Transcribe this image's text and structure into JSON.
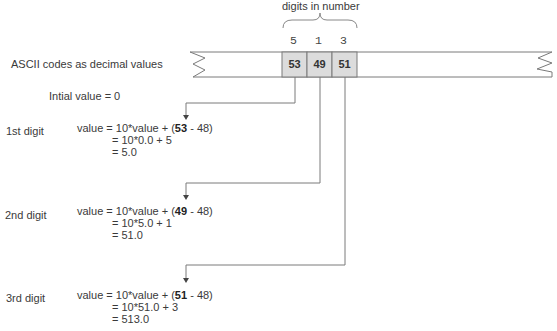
{
  "header": {
    "bracket_label": "digits in number"
  },
  "strip": {
    "label": "ASCII codes as decimal values",
    "digits": [
      "5",
      "1",
      "3"
    ],
    "codes": [
      "53",
      "49",
      "51"
    ],
    "box_fill": "#dcdcdc",
    "line_color": "#7a7a7a"
  },
  "initial": {
    "text": "Intial value = 0"
  },
  "steps": [
    {
      "label": "1st digit",
      "line1_prefix": "value = 10*value + (",
      "code": "53",
      "line1_suffix": " - 48)",
      "line2": "= 10*0.0 + 5",
      "line3": "= 5.0"
    },
    {
      "label": "2nd digit",
      "line1_prefix": "value = 10*value + (",
      "code": "49",
      "line1_suffix": " - 48)",
      "line2": "= 10*5.0 + 1",
      "line3": "= 51.0"
    },
    {
      "label": "3rd digit",
      "line1_prefix": "value = 10*value + (",
      "code": "51",
      "line1_suffix": " - 48)",
      "line2": "= 10*51.0 + 3",
      "line3": "= 513.0"
    }
  ]
}
